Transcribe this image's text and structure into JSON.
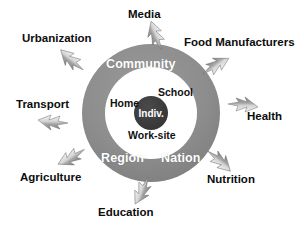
{
  "diagram": {
    "type": "concentric-circles-influence-diagram",
    "colors": {
      "background": "#ffffff",
      "outer_ring": "#8d8d8d",
      "inner_circle": "#ffffff",
      "core_circle": "#3a3a3a",
      "ring_text": "#ffffff",
      "inner_text": "#111111",
      "outer_text": "#0d0d0d",
      "arrow_light": "#e6e6e6",
      "arrow_dark": "#8a8a8a"
    },
    "geometry": {
      "center_x": 151,
      "center_y": 113,
      "outer_radius": 69,
      "inner_radius": 46,
      "core_radius": 17
    },
    "core": {
      "label": "Indiv."
    },
    "inner_ring_labels": [
      {
        "label": "School",
        "x": 158,
        "y": 86
      },
      {
        "label": "Home",
        "x": 110,
        "y": 97
      },
      {
        "label": "Work-site",
        "x": 128,
        "y": 129
      }
    ],
    "outer_ring_labels": [
      {
        "label": "Community",
        "x": 106,
        "y": 57
      },
      {
        "label": "Region",
        "x": 101,
        "y": 151
      },
      {
        "label": "Nation",
        "x": 161,
        "y": 151
      }
    ],
    "external_influences": [
      {
        "label": "Media",
        "label_x": 128,
        "label_y": 8,
        "arrow_x": 140,
        "arrow_y": 26,
        "arrow_rotation": 64
      },
      {
        "label": "Urbanization",
        "label_x": 22,
        "label_y": 32,
        "arrow_x": 56,
        "arrow_y": 51,
        "arrow_rotation": 36
      },
      {
        "label": "Food Manufacturers",
        "label_x": 184,
        "label_y": 36,
        "arrow_x": 200,
        "arrow_y": 55,
        "arrow_rotation": 143
      },
      {
        "label": "Transport",
        "label_x": 16,
        "label_y": 98,
        "arrow_x": 38,
        "arrow_y": 113,
        "arrow_rotation": 0
      },
      {
        "label": "Health",
        "label_x": 247,
        "label_y": 110,
        "arrow_x": 228,
        "arrow_y": 94,
        "arrow_rotation": 180
      },
      {
        "label": "Agriculture",
        "label_x": 20,
        "label_y": 171,
        "arrow_x": 57,
        "arrow_y": 148,
        "arrow_rotation": 325
      },
      {
        "label": "Nutrition",
        "label_x": 207,
        "label_y": 173,
        "arrow_x": 205,
        "arrow_y": 150,
        "arrow_rotation": 216
      },
      {
        "label": "Education",
        "label_x": 98,
        "label_y": 206,
        "arrow_x": 128,
        "arrow_y": 181,
        "arrow_rotation": 290
      }
    ]
  }
}
